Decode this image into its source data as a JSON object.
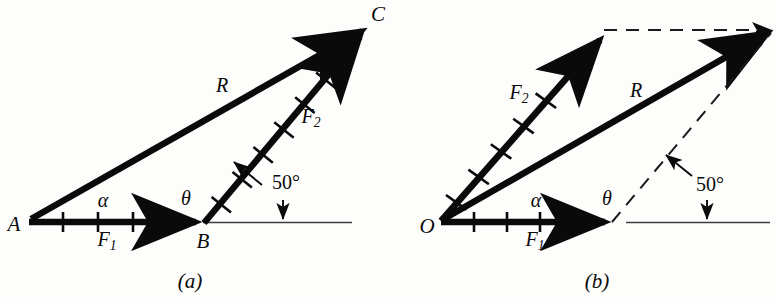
{
  "figure": {
    "background_color": "#fdfdfc",
    "ink_color": "#0a0a0a",
    "thin_line_color": "#3a3a3a",
    "width": 777,
    "height": 302
  },
  "diagram_a": {
    "caption": "(a)",
    "points": {
      "A": "A",
      "B": "B",
      "C": "C"
    },
    "vectors": {
      "f1_label": "F",
      "f1_sub": "1",
      "f2_label": "F",
      "f2_sub": "2",
      "r_label": "R"
    },
    "angles": {
      "alpha": "α",
      "theta": "θ",
      "fifty": "50°"
    },
    "tick_counts": {
      "f1": 4,
      "f2": 6,
      "r": 0
    }
  },
  "diagram_b": {
    "caption": "(b)",
    "points": {
      "O": "O"
    },
    "vectors": {
      "f1_label": "F",
      "f1_sub": "1",
      "f2_label": "F",
      "f2_sub": "2",
      "r_label": "R"
    },
    "angles": {
      "alpha": "α",
      "theta": "θ",
      "fifty": "50°"
    },
    "tick_counts": {
      "f1": 4,
      "f2": 6
    }
  }
}
